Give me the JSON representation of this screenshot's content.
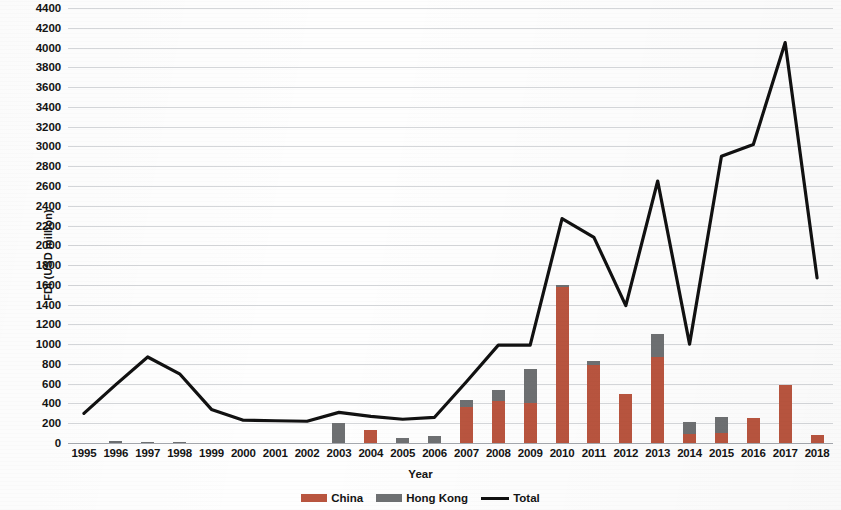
{
  "axes": {
    "ylabel": "FDI (USD million)",
    "xlabel": "Year",
    "yticks": [
      0,
      200,
      400,
      600,
      800,
      1000,
      1200,
      1400,
      1600,
      1800,
      2000,
      2200,
      2400,
      2600,
      2800,
      3000,
      3200,
      3400,
      3600,
      3800,
      4000,
      4200,
      4400
    ]
  },
  "legend": {
    "items": [
      {
        "label": "China",
        "type": "bar",
        "color": "#b9553f"
      },
      {
        "label": "Hong Kong",
        "type": "bar",
        "color": "#6e7072"
      },
      {
        "label": "Total",
        "type": "line",
        "color": "#111111"
      }
    ]
  },
  "colors": {
    "china": "#b9553f",
    "hong_kong": "#6e7072",
    "total": "#111111",
    "grid": "#787d87",
    "background": "#fefefe"
  },
  "chart_data": {
    "type": "bar",
    "title": "",
    "xlabel": "Year",
    "ylabel": "FDI (USD million)",
    "ylim": [
      0,
      4400
    ],
    "ytick_step": 200,
    "grid": true,
    "legend_position": "bottom",
    "stacked": true,
    "categories": [
      "1995",
      "1996",
      "1997",
      "1998",
      "1999",
      "2000",
      "2001",
      "2002",
      "2003",
      "2004",
      "2005",
      "2006",
      "2007",
      "2008",
      "2009",
      "2010",
      "2011",
      "2012",
      "2013",
      "2014",
      "2015",
      "2016",
      "2017",
      "2018"
    ],
    "series": [
      {
        "name": "China",
        "kind": "bar",
        "color": "#b9553f",
        "values": [
          0,
          0,
          0,
          0,
          0,
          0,
          0,
          0,
          0,
          130,
          0,
          0,
          360,
          420,
          400,
          1580,
          790,
          500,
          870,
          90,
          100,
          250,
          590,
          80
        ]
      },
      {
        "name": "Hong Kong",
        "kind": "bar",
        "color": "#6e7072",
        "values": [
          0,
          20,
          10,
          10,
          0,
          0,
          0,
          0,
          200,
          0,
          50,
          70,
          80,
          120,
          350,
          20,
          40,
          0,
          230,
          120,
          160,
          0,
          0,
          0
        ]
      },
      {
        "name": "Total",
        "kind": "line",
        "color": "#111111",
        "values": [
          300,
          590,
          870,
          700,
          340,
          230,
          225,
          220,
          310,
          270,
          240,
          260,
          620,
          990,
          990,
          2270,
          2080,
          1390,
          2650,
          1000,
          2900,
          3020,
          4050,
          1670
        ]
      }
    ]
  }
}
